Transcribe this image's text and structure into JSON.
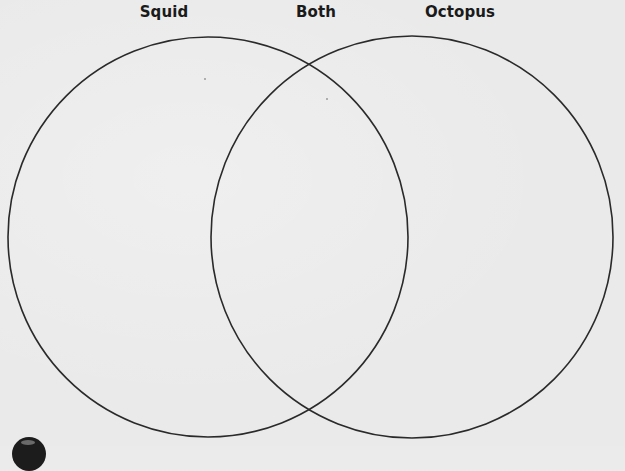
{
  "diagram": {
    "type": "venn",
    "sets": [
      {
        "id": "left",
        "label": "Squid",
        "cx": 208,
        "cy": 237,
        "r": 200
      },
      {
        "id": "right",
        "label": "Octopus",
        "cx": 412,
        "cy": 237,
        "r": 201
      }
    ],
    "intersection_label": "Both",
    "labels": {
      "left": "Squid",
      "middle": "Both",
      "right": "Octopus"
    },
    "stroke_color": "#2a2a2a",
    "background_color": "#eaeaea",
    "corner_icon": "partial-round-icon"
  }
}
